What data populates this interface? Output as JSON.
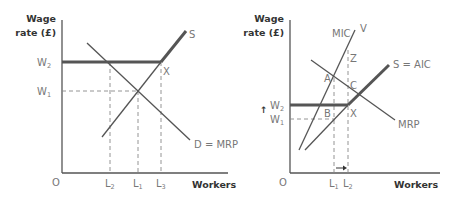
{
  "left_diagram": {
    "y_axis_label_line1": "Wage",
    "y_axis_label_line2": "rate (£)",
    "x_axis_label": "Workers",
    "origin": "O",
    "wage_levels": [
      {
        "label": "W",
        "sub": "2"
      },
      {
        "label": "W",
        "sub": "1"
      }
    ],
    "labour_levels": [
      {
        "label": "L",
        "sub": "2"
      },
      {
        "label": "L",
        "sub": "1"
      },
      {
        "label": "L",
        "sub": "3"
      }
    ],
    "curves": {
      "supply": "S",
      "demand": "D = MRP"
    },
    "points": {
      "x": "X"
    }
  },
  "right_diagram": {
    "y_axis_label_line1": "Wage",
    "y_axis_label_line2": "rate (£)",
    "x_axis_label": "Workers",
    "origin": "O",
    "wage_arrow": "↑",
    "wage_levels": [
      {
        "label": "W",
        "sub": "2"
      },
      {
        "label": "W",
        "sub": "1"
      }
    ],
    "labour_levels": [
      {
        "label": "L",
        "sub": "1"
      },
      {
        "label": "L",
        "sub": "2"
      }
    ],
    "curves": {
      "mic": "MIC",
      "mic_end": "V",
      "supply": "S = AIC",
      "demand": "MRP"
    },
    "points": {
      "a": "A",
      "b": "B",
      "c": "C",
      "x": "X",
      "z": "Z"
    }
  },
  "colors": {
    "line": "#555555",
    "bold_line": "#555555",
    "dashed": "#888888",
    "label": "#777777",
    "axis_title": "#333333"
  }
}
